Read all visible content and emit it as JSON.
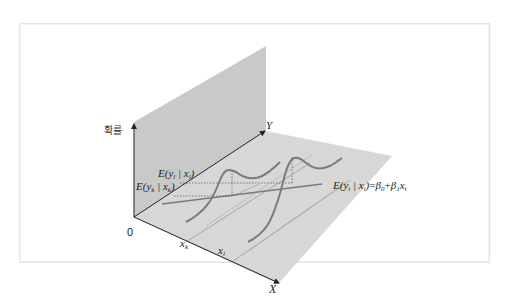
{
  "diagram": {
    "y_axis_vertical_label": "확률",
    "origin_label": "0",
    "y_axis_label": "Y",
    "x_axis_label": "X",
    "x_ticks": [
      {
        "base": "x",
        "sub": "k"
      },
      {
        "base": "x",
        "sub": "l"
      }
    ],
    "conditional_expectations": [
      {
        "text_before": "E(y",
        "sub1": "l",
        "mid": " | x",
        "sub2": "l",
        "after": ")"
      },
      {
        "text_before": "E(y",
        "sub1": "k",
        "mid": " | x",
        "sub2": "k",
        "after": ")"
      }
    ],
    "regression_equation": {
      "lhs_before": "E(y",
      "lhs_sub1": "i",
      "lhs_mid": " | x",
      "lhs_sub2": "i",
      "lhs_after": ")",
      "equals": "=",
      "beta0": "β",
      "beta0_sub": "0",
      "plus": "+",
      "beta1": "β",
      "beta1_sub": "1",
      "x": "x",
      "x_sub": "i"
    },
    "colors": {
      "wall": "#c9c9c9",
      "floor": "#dedede",
      "curve": "#7a7a7a",
      "axis": "#222222"
    }
  }
}
